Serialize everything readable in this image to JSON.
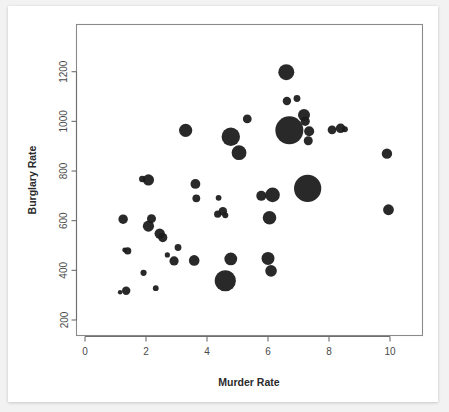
{
  "chart_data": {
    "type": "scatter",
    "title": "",
    "xlabel": "Murder Rate",
    "ylabel": "Burglary Rate",
    "xlim": [
      0.0,
      11.0
    ],
    "ylim": [
      180,
      1310
    ],
    "xticks": [
      0,
      2,
      4,
      6,
      8,
      10
    ],
    "xtick_labels": [
      "0",
      "2",
      "4",
      "6",
      "8",
      "10"
    ],
    "yticks": [
      200,
      400,
      600,
      800,
      1000,
      1200
    ],
    "ytick_labels": [
      "200",
      "400",
      "600",
      "800",
      "1000",
      "1200"
    ],
    "grid": false,
    "legend": null,
    "marker_color": "#1c1c1c",
    "size_encoding": "bubble-area",
    "points": [
      {
        "x": 1.15,
        "y": 312,
        "r": 2.2
      },
      {
        "x": 1.25,
        "y": 606,
        "r": 4.7
      },
      {
        "x": 1.35,
        "y": 318,
        "r": 4.2
      },
      {
        "x": 1.3,
        "y": 482,
        "r": 2.4
      },
      {
        "x": 1.4,
        "y": 478,
        "r": 3.6
      },
      {
        "x": 1.88,
        "y": 768,
        "r": 3.3
      },
      {
        "x": 1.92,
        "y": 390,
        "r": 3.1
      },
      {
        "x": 2.08,
        "y": 764,
        "r": 5.6
      },
      {
        "x": 2.08,
        "y": 578,
        "r": 5.6
      },
      {
        "x": 2.18,
        "y": 608,
        "r": 4.5
      },
      {
        "x": 2.32,
        "y": 328,
        "r": 2.9
      },
      {
        "x": 2.45,
        "y": 548,
        "r": 5.2
      },
      {
        "x": 2.55,
        "y": 532,
        "r": 4.6
      },
      {
        "x": 2.7,
        "y": 462,
        "r": 2.6
      },
      {
        "x": 2.92,
        "y": 438,
        "r": 4.6
      },
      {
        "x": 3.05,
        "y": 492,
        "r": 3.4
      },
      {
        "x": 3.3,
        "y": 964,
        "r": 6.6
      },
      {
        "x": 3.58,
        "y": 440,
        "r": 5.3
      },
      {
        "x": 3.62,
        "y": 748,
        "r": 4.9
      },
      {
        "x": 3.65,
        "y": 690,
        "r": 3.9
      },
      {
        "x": 4.35,
        "y": 626,
        "r": 3.6
      },
      {
        "x": 4.38,
        "y": 692,
        "r": 2.9
      },
      {
        "x": 4.52,
        "y": 638,
        "r": 4.2
      },
      {
        "x": 4.6,
        "y": 622,
        "r": 3.0
      },
      {
        "x": 4.6,
        "y": 358,
        "r": 10.6
      },
      {
        "x": 4.78,
        "y": 446,
        "r": 6.4
      },
      {
        "x": 4.78,
        "y": 938,
        "r": 9.2
      },
      {
        "x": 5.05,
        "y": 874,
        "r": 7.4
      },
      {
        "x": 5.32,
        "y": 1010,
        "r": 4.4
      },
      {
        "x": 5.78,
        "y": 700,
        "r": 5.0
      },
      {
        "x": 6.0,
        "y": 448,
        "r": 6.5
      },
      {
        "x": 6.05,
        "y": 612,
        "r": 6.8
      },
      {
        "x": 6.1,
        "y": 398,
        "r": 5.8
      },
      {
        "x": 6.15,
        "y": 704,
        "r": 7.3
      },
      {
        "x": 6.6,
        "y": 1198,
        "r": 8.0
      },
      {
        "x": 6.62,
        "y": 1082,
        "r": 4.2
      },
      {
        "x": 6.7,
        "y": 964,
        "r": 14.0
      },
      {
        "x": 6.95,
        "y": 1092,
        "r": 3.4
      },
      {
        "x": 7.18,
        "y": 1026,
        "r": 6.0
      },
      {
        "x": 7.22,
        "y": 1000,
        "r": 4.6
      },
      {
        "x": 7.3,
        "y": 730,
        "r": 13.6
      },
      {
        "x": 7.35,
        "y": 960,
        "r": 5.0
      },
      {
        "x": 7.32,
        "y": 922,
        "r": 4.5
      },
      {
        "x": 8.1,
        "y": 966,
        "r": 4.4
      },
      {
        "x": 8.38,
        "y": 972,
        "r": 4.8
      },
      {
        "x": 8.52,
        "y": 968,
        "r": 3.0
      },
      {
        "x": 9.9,
        "y": 870,
        "r": 5.2
      },
      {
        "x": 9.95,
        "y": 644,
        "r": 5.4
      }
    ]
  },
  "figure": {
    "background": "#ffffff",
    "panel_background": "#f2f2f2",
    "frame_color": "#8a8a8a"
  }
}
